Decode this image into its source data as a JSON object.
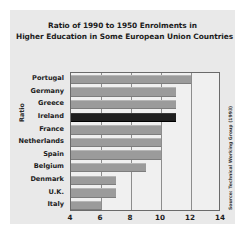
{
  "chart_data": {
    "type": "bar",
    "orientation": "horizontal",
    "title": "Ratio of 1990 to 1950 Enrolments in Higher Education in Some European Union Countries",
    "title_lines": [
      "Ratio of 1990 to 1950 Enrolments in",
      "Higher Education in Some European Union Countries"
    ],
    "xlabel": "",
    "ylabel": "Ratio",
    "categories": [
      "Portugal",
      "Germany",
      "Greece",
      "Ireland",
      "France",
      "Netherlands",
      "Spain",
      "Belgium",
      "Denmark",
      "U.K.",
      "Italy"
    ],
    "values": [
      12,
      11,
      11,
      11,
      10,
      10,
      10,
      9,
      7,
      7,
      6
    ],
    "xlim": [
      4,
      14
    ],
    "xticks": [
      4,
      6,
      8,
      10,
      12,
      14
    ],
    "xtick_labels": [
      "4",
      "6",
      "8",
      "10",
      "12",
      "14"
    ],
    "grid": "vertical",
    "legend": "none",
    "highlight_category": "Ireland",
    "bar_color": "#9b9b9b",
    "highlight_color": "#1f1f1f",
    "plot_background": "#f0f0f0",
    "figure_background": "#e9e9e9",
    "annotation": "Source: Technical Working Group (1993)"
  }
}
